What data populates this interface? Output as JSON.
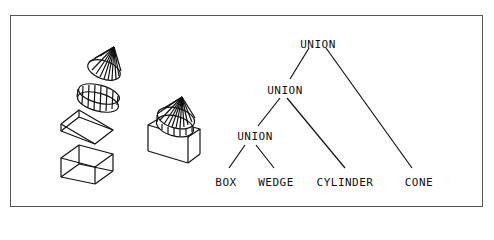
{
  "diagram": {
    "stroke_color": "#111111",
    "frame_color": "#555555",
    "primitives": [
      "cone",
      "cylinder",
      "wedge",
      "box"
    ],
    "combined_object": "box-wedge-cylinder-cone union",
    "tree": {
      "root": {
        "label": "UNION"
      },
      "level2": {
        "label": "UNION"
      },
      "level3": {
        "label": "UNION"
      },
      "leaves": [
        {
          "label": "BOX"
        },
        {
          "label": "WEDGE"
        },
        {
          "label": "CYLINDER"
        },
        {
          "label": "CONE"
        }
      ]
    }
  }
}
